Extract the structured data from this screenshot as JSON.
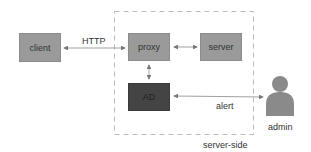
{
  "diagram": {
    "nodes": {
      "client": {
        "label": "client"
      },
      "proxy": {
        "label": "proxy"
      },
      "server": {
        "label": "server"
      },
      "ad": {
        "label": "AD"
      },
      "admin": {
        "label": "admin",
        "icon": "person-icon"
      }
    },
    "edges": {
      "client_proxy": {
        "label": "HTTP"
      },
      "proxy_server": {
        "label": ""
      },
      "proxy_ad": {
        "label": ""
      },
      "ad_admin": {
        "label": "alert"
      }
    },
    "group": {
      "label": "server-side"
    }
  },
  "colors": {
    "box_light": "#9a9a9a",
    "box_dark": "#444444",
    "person": "#8a8a8a",
    "line": "#888888"
  }
}
